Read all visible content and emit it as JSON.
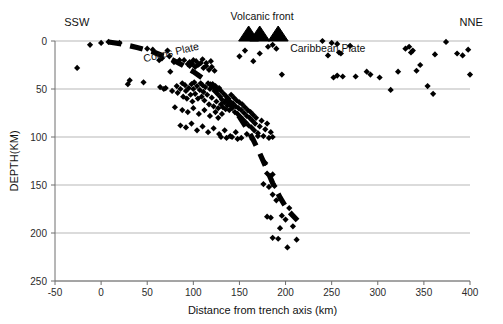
{
  "figure": {
    "kind": "seismic-cross-section-scatter"
  },
  "annotations": {
    "left_compass": "SSW",
    "right_compass": "NNE",
    "cocos_plate": "Cocos Plate",
    "caribbean_plate": "Caribbean Plate",
    "volcanic_front": "Volcanic front"
  },
  "chart_data": {
    "type": "scatter",
    "title": "",
    "subtitle": "",
    "xlabel": "Distance from trench axis (km)",
    "ylabel": "DEPTH(KM)",
    "xlim": [
      -50,
      400
    ],
    "ylim": [
      0,
      250
    ],
    "y_inverted": true,
    "grid": "horizontal",
    "legend": "none",
    "xticks": [
      -50,
      0,
      50,
      100,
      150,
      200,
      250,
      300,
      350,
      400
    ],
    "xticklabels": [
      "-50",
      "0",
      "50",
      "100",
      "150",
      "200",
      "250",
      "300",
      "350",
      "400"
    ],
    "yticks": [
      0,
      50,
      100,
      150,
      200,
      250
    ],
    "yticklabels": [
      "0",
      "50",
      "100",
      "150",
      "200",
      "250"
    ],
    "marker": "diamond",
    "marker_color": "#000000",
    "text_annotations": [
      {
        "text": "SSW",
        "x": -40,
        "y": -16
      },
      {
        "text": "NNE",
        "x": 390,
        "y": -16
      },
      {
        "text": "Cocos Plate",
        "x": 10,
        "y": 18,
        "rotation": -13
      },
      {
        "text": "Caribbean Plate",
        "x": 205,
        "y": 6
      },
      {
        "text": "Volcanic front",
        "x": 155,
        "y": -22
      }
    ],
    "volcano_symbols": {
      "label": "Volcanic front",
      "marker": "triangle",
      "depth": 0,
      "x_positions": [
        160,
        172,
        192
      ]
    },
    "slab_interface": {
      "label": "Wadati-Benioff slab top (dashed)",
      "style": "thick-dashed",
      "color": "#000000",
      "points": [
        [
          8,
          1
        ],
        [
          22,
          3
        ],
        [
          40,
          7
        ],
        [
          58,
          12
        ],
        [
          74,
          18
        ],
        [
          88,
          25
        ],
        [
          100,
          32
        ],
        [
          112,
          40
        ],
        [
          123,
          49
        ],
        [
          133,
          58
        ],
        [
          142,
          68
        ],
        [
          150,
          79
        ],
        [
          158,
          91
        ],
        [
          165,
          103
        ],
        [
          172,
          117
        ],
        [
          179,
          132
        ],
        [
          186,
          148
        ],
        [
          194,
          163
        ],
        [
          203,
          177
        ],
        [
          213,
          187
        ]
      ]
    },
    "series": [
      {
        "name": "Earthquake hypocenters",
        "marker": "diamond",
        "color": "#000000",
        "points": [
          [
            -26,
            28
          ],
          [
            -12,
            4
          ],
          [
            0,
            2
          ],
          [
            8,
            1
          ],
          [
            20,
            2
          ],
          [
            29,
            45
          ],
          [
            31,
            41
          ],
          [
            46,
            43
          ],
          [
            50,
            8
          ],
          [
            56,
            9
          ],
          [
            60,
            13
          ],
          [
            63,
            20
          ],
          [
            64,
            48
          ],
          [
            66,
            18
          ],
          [
            68,
            50
          ],
          [
            70,
            49
          ],
          [
            72,
            10
          ],
          [
            74,
            16
          ],
          [
            75,
            32
          ],
          [
            77,
            52
          ],
          [
            79,
            22
          ],
          [
            80,
            69
          ],
          [
            82,
            47
          ],
          [
            83,
            54
          ],
          [
            85,
            20
          ],
          [
            86,
            50
          ],
          [
            88,
            44
          ],
          [
            89,
            58
          ],
          [
            90,
            20
          ],
          [
            91,
            46
          ],
          [
            92,
            52
          ],
          [
            93,
            60
          ],
          [
            94,
            24
          ],
          [
            95,
            49
          ],
          [
            96,
            22
          ],
          [
            97,
            56
          ],
          [
            98,
            45
          ],
          [
            99,
            63
          ],
          [
            100,
            20
          ],
          [
            100,
            50
          ],
          [
            101,
            43
          ],
          [
            102,
            55
          ],
          [
            103,
            21
          ],
          [
            104,
            47
          ],
          [
            105,
            60
          ],
          [
            106,
            24
          ],
          [
            107,
            51
          ],
          [
            108,
            44
          ],
          [
            109,
            58
          ],
          [
            110,
            19
          ],
          [
            110,
            46
          ],
          [
            111,
            53
          ],
          [
            112,
            62
          ],
          [
            113,
            48
          ],
          [
            114,
            23
          ],
          [
            115,
            56
          ],
          [
            116,
            44
          ],
          [
            117,
            66
          ],
          [
            118,
            50
          ],
          [
            119,
            21
          ],
          [
            120,
            59
          ],
          [
            121,
            45
          ],
          [
            122,
            68
          ],
          [
            123,
            52
          ],
          [
            124,
            47
          ],
          [
            125,
            63
          ],
          [
            126,
            55
          ],
          [
            127,
            70
          ],
          [
            128,
            49
          ],
          [
            129,
            58
          ],
          [
            130,
            66
          ],
          [
            130,
            52
          ],
          [
            131,
            61
          ],
          [
            132,
            69
          ],
          [
            133,
            55
          ],
          [
            134,
            64
          ],
          [
            135,
            71
          ],
          [
            136,
            58
          ],
          [
            137,
            67
          ],
          [
            138,
            60
          ],
          [
            139,
            72
          ],
          [
            140,
            63
          ],
          [
            141,
            56
          ],
          [
            142,
            70
          ],
          [
            143,
            65
          ],
          [
            144,
            59
          ],
          [
            145,
            74
          ],
          [
            146,
            68
          ],
          [
            147,
            62
          ],
          [
            148,
            76
          ],
          [
            149,
            70
          ],
          [
            150,
            64
          ],
          [
            151,
            79
          ],
          [
            152,
            72
          ],
          [
            153,
            66
          ],
          [
            154,
            82
          ],
          [
            155,
            75
          ],
          [
            156,
            69
          ],
          [
            157,
            85
          ],
          [
            158,
            78
          ],
          [
            159,
            72
          ],
          [
            160,
            88
          ],
          [
            161,
            80
          ],
          [
            162,
            74
          ],
          [
            163,
            90
          ],
          [
            164,
            83
          ],
          [
            165,
            77
          ],
          [
            166,
            93
          ],
          [
            167,
            86
          ],
          [
            168,
            80
          ],
          [
            170,
            96
          ],
          [
            172,
            89
          ],
          [
            174,
            83
          ],
          [
            176,
            99
          ],
          [
            178,
            92
          ],
          [
            180,
            86
          ],
          [
            182,
            101
          ],
          [
            184,
            95
          ],
          [
            186,
            100
          ],
          [
            96,
            26
          ],
          [
            99,
            24
          ],
          [
            102,
            27
          ],
          [
            105,
            25
          ],
          [
            108,
            23
          ],
          [
            111,
            28
          ],
          [
            114,
            26
          ],
          [
            117,
            30
          ],
          [
            120,
            27
          ],
          [
            123,
            31
          ],
          [
            86,
            88
          ],
          [
            92,
            90
          ],
          [
            98,
            86
          ],
          [
            104,
            93
          ],
          [
            110,
            89
          ],
          [
            116,
            95
          ],
          [
            122,
            91
          ],
          [
            128,
            97
          ],
          [
            134,
            93
          ],
          [
            140,
            99
          ],
          [
            146,
            95
          ],
          [
            152,
            101
          ],
          [
            158,
            97
          ],
          [
            164,
            102
          ],
          [
            170,
            99
          ],
          [
            130,
            100
          ],
          [
            136,
            101
          ],
          [
            142,
            100
          ],
          [
            148,
            102
          ],
          [
            88,
            72
          ],
          [
            94,
            74
          ],
          [
            100,
            70
          ],
          [
            106,
            76
          ],
          [
            112,
            72
          ],
          [
            118,
            78
          ],
          [
            124,
            74
          ],
          [
            127,
            80
          ],
          [
            131,
            76
          ],
          [
            150,
            16
          ],
          [
            156,
            10
          ],
          [
            165,
            21
          ],
          [
            172,
            13
          ],
          [
            181,
            6
          ],
          [
            186,
            4
          ],
          [
            190,
            8
          ],
          [
            196,
            35
          ],
          [
            178,
            127
          ],
          [
            180,
            138
          ],
          [
            186,
            139
          ],
          [
            182,
            152
          ],
          [
            188,
            151
          ],
          [
            186,
            160
          ],
          [
            180,
            183
          ],
          [
            184,
            184
          ],
          [
            186,
            205
          ],
          [
            192,
            206
          ],
          [
            194,
            195
          ],
          [
            196,
            182
          ],
          [
            200,
            186
          ],
          [
            202,
            215
          ],
          [
            204,
            174
          ],
          [
            208,
            193
          ],
          [
            212,
            207
          ],
          [
            176,
            149
          ],
          [
            190,
            166
          ],
          [
            246,
            15
          ],
          [
            252,
            38
          ],
          [
            256,
            36
          ],
          [
            258,
            12
          ],
          [
            260,
            13
          ],
          [
            262,
            37
          ],
          [
            276,
            37
          ],
          [
            288,
            32
          ],
          [
            292,
            35
          ],
          [
            302,
            38
          ],
          [
            314,
            51
          ],
          [
            322,
            32
          ],
          [
            330,
            8
          ],
          [
            334,
            6
          ],
          [
            336,
            12
          ],
          [
            338,
            10
          ],
          [
            342,
            31
          ],
          [
            346,
            25
          ],
          [
            354,
            47
          ],
          [
            360,
            55
          ],
          [
            362,
            14
          ],
          [
            374,
            1
          ],
          [
            386,
            13
          ],
          [
            392,
            15
          ],
          [
            398,
            9
          ],
          [
            400,
            35
          ],
          [
            240,
            0
          ],
          [
            250,
            2
          ],
          [
            256,
            3
          ],
          [
            270,
            5
          ]
        ]
      }
    ]
  }
}
